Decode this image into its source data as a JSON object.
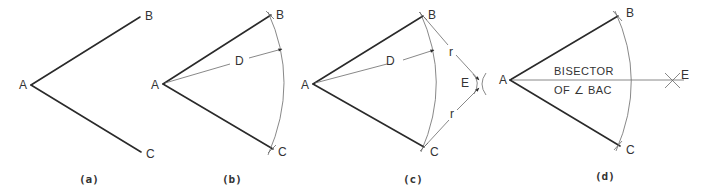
{
  "diagram": {
    "panels": [
      {
        "caption": "(a)",
        "points": {
          "A": "A",
          "B": "B",
          "C": "C"
        }
      },
      {
        "caption": "(b)",
        "points": {
          "A": "A",
          "B": "B",
          "C": "C"
        },
        "radius_label": "D"
      },
      {
        "caption": "(c)",
        "points": {
          "A": "A",
          "B": "B",
          "C": "C",
          "E": "E"
        },
        "radius_label": "D",
        "arc_radius_label_upper": "r",
        "arc_radius_label_lower": "r"
      },
      {
        "caption": "(d)",
        "points": {
          "A": "A",
          "B": "B",
          "C": "C",
          "E": "E"
        },
        "bisector_label_line1": "BISECTOR",
        "bisector_label_line2": "OF ∠ BAC"
      }
    ]
  }
}
